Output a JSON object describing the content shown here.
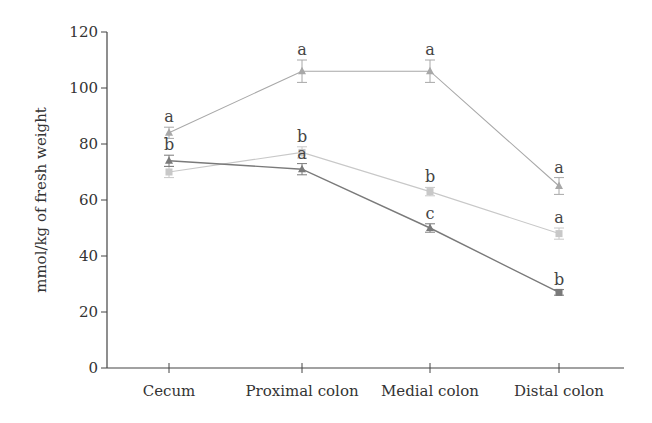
{
  "chart_data": {
    "type": "line",
    "title": "",
    "xlabel": "",
    "ylabel": "mmol/kg of fresh weight",
    "ylim": [
      0,
      120
    ],
    "yticks": [
      0,
      20,
      40,
      60,
      80,
      100,
      120
    ],
    "grid": false,
    "legend": null,
    "categories": [
      "Cecum",
      "Proximal colon",
      "Medial colon",
      "Distal colon"
    ],
    "series": [
      {
        "name": "Series 1 (light gray triangles)",
        "marker": "triangle",
        "color": "#a8a8a8",
        "values": [
          84,
          106,
          106,
          65
        ],
        "errors": [
          2,
          4,
          4,
          3
        ],
        "significance": [
          "a",
          "a",
          "a",
          "a"
        ]
      },
      {
        "name": "Series 2 (dark gray triangles/square)",
        "marker": "triangle",
        "color": "#7a7a7a",
        "values": [
          74,
          71,
          50,
          27
        ],
        "errors": [
          2,
          2,
          1.5,
          1
        ],
        "significance": [
          "b",
          "a",
          "c",
          "b"
        ]
      },
      {
        "name": "Series 3 (very light gray squares)",
        "marker": "square",
        "color": "#c8c8c8",
        "values": [
          70,
          77,
          63,
          48
        ],
        "errors": [
          2,
          2,
          1.5,
          2
        ],
        "significance": [
          "",
          "b",
          "b",
          "a"
        ]
      }
    ]
  }
}
